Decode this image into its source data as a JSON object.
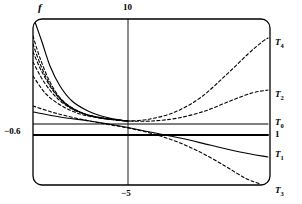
{
  "figure": {
    "type": "line-plot",
    "background": "#ffffff",
    "stroke_color": "#000000",
    "frame": {
      "x": 33,
      "y": 19,
      "width": 237,
      "height": 166,
      "corner_radius": 9,
      "style": "rounded-rectangle-border"
    },
    "axis_labels": {
      "vertical_axis": "f"
    },
    "tick_labels": {
      "top": "10",
      "bottom": "−5",
      "left": "−0.6"
    },
    "curve_labels": [
      {
        "name": "T4",
        "text": "T",
        "sub": "4"
      },
      {
        "name": "T2",
        "text": "T",
        "sub": "2"
      },
      {
        "name": "T0",
        "text": "T",
        "sub": "0"
      },
      {
        "name": "one",
        "text": "1",
        "sub": ""
      },
      {
        "name": "T1",
        "text": "T",
        "sub": "1"
      },
      {
        "name": "T3",
        "text": "T",
        "sub": "3"
      }
    ]
  },
  "chart_data": {
    "type": "line",
    "title": "",
    "xlabel": "",
    "ylabel": "f",
    "grid": false,
    "legend_position": "right-edge-inline",
    "axis_ticks": {
      "x": [
        {
          "label": "10",
          "position": "top",
          "pixel_x": 128
        },
        {
          "label": "−5",
          "position": "bottom",
          "pixel_x": 128
        }
      ],
      "y": [
        {
          "label": "−0.6",
          "position": "left",
          "pixel_y": 131
        }
      ]
    },
    "note": "Curves all pass through a common crossing region near x-tick 128, y 120; dashed curves diverge steeply at the left edge and fan out to the right edge endpoints labelled T4, T2, T1, T3; solid near-horizontal lines mark T0 and 1.",
    "series": [
      {
        "name": "T4",
        "style": "dashed",
        "endpoint_label": "T4",
        "points": [
          [
            33,
            36
          ],
          [
            40,
            58
          ],
          [
            50,
            82
          ],
          [
            62,
            100
          ],
          [
            78,
            111
          ],
          [
            96,
            117
          ],
          [
            115,
            120
          ],
          [
            128,
            121
          ],
          [
            150,
            119
          ],
          [
            175,
            112
          ],
          [
            200,
            98
          ],
          [
            225,
            76
          ],
          [
            248,
            54
          ],
          [
            262,
            42
          ],
          [
            268,
            38
          ]
        ]
      },
      {
        "name": "T2",
        "style": "dashed",
        "endpoint_label": "T2",
        "points": [
          [
            33,
            52
          ],
          [
            42,
            72
          ],
          [
            54,
            92
          ],
          [
            68,
            106
          ],
          [
            85,
            114
          ],
          [
            103,
            118
          ],
          [
            120,
            120
          ],
          [
            128,
            121
          ],
          [
            152,
            121
          ],
          [
            178,
            118
          ],
          [
            205,
            111
          ],
          [
            230,
            101
          ],
          [
            252,
            93
          ],
          [
            268,
            90
          ]
        ]
      },
      {
        "name": "solid-main",
        "style": "solid",
        "endpoint_label": "",
        "points": [
          [
            35,
            22
          ],
          [
            42,
            42
          ],
          [
            50,
            66
          ],
          [
            60,
            86
          ],
          [
            72,
            101
          ],
          [
            88,
            111
          ],
          [
            105,
            117
          ],
          [
            120,
            120
          ],
          [
            128,
            121
          ]
        ]
      },
      {
        "name": "T0",
        "style": "solid",
        "endpoint_label": "T0",
        "points": [
          [
            33,
            124
          ],
          [
            128,
            124
          ],
          [
            268,
            124
          ]
        ]
      },
      {
        "name": "one",
        "style": "solid-thick",
        "endpoint_label": "1",
        "points": [
          [
            33,
            135
          ],
          [
            128,
            135
          ],
          [
            268,
            135
          ]
        ]
      },
      {
        "name": "T1",
        "style": "solid",
        "endpoint_label": "T1",
        "points": [
          [
            33,
            112
          ],
          [
            60,
            117
          ],
          [
            90,
            121
          ],
          [
            120,
            126
          ],
          [
            150,
            132
          ],
          [
            180,
            138
          ],
          [
            210,
            145
          ],
          [
            240,
            152
          ],
          [
            268,
            157
          ]
        ]
      },
      {
        "name": "T3",
        "style": "dashed",
        "endpoint_label": "T3",
        "points": [
          [
            33,
            106
          ],
          [
            55,
            113
          ],
          [
            80,
            119
          ],
          [
            105,
            124
          ],
          [
            128,
            128
          ],
          [
            150,
            133
          ],
          [
            175,
            141
          ],
          [
            200,
            152
          ],
          [
            225,
            166
          ],
          [
            245,
            178
          ],
          [
            260,
            184
          ]
        ]
      },
      {
        "name": "inner-dashed-a",
        "style": "dashed",
        "endpoint_label": "",
        "points": [
          [
            33,
            44
          ],
          [
            41,
            66
          ],
          [
            52,
            88
          ],
          [
            65,
            103
          ],
          [
            82,
            113
          ],
          [
            100,
            118
          ],
          [
            118,
            120
          ],
          [
            128,
            121
          ]
        ]
      },
      {
        "name": "inner-dashed-b",
        "style": "dashed",
        "endpoint_label": "",
        "points": [
          [
            33,
            62
          ],
          [
            44,
            82
          ],
          [
            58,
            99
          ],
          [
            74,
            110
          ],
          [
            92,
            116
          ],
          [
            110,
            119
          ],
          [
            126,
            121
          ],
          [
            128,
            121
          ]
        ]
      },
      {
        "name": "inner-dashed-c",
        "style": "dashed",
        "endpoint_label": "",
        "points": [
          [
            33,
            76
          ],
          [
            46,
            94
          ],
          [
            62,
            106
          ],
          [
            80,
            114
          ],
          [
            99,
            118
          ],
          [
            118,
            120
          ],
          [
            128,
            121
          ]
        ]
      }
    ]
  }
}
